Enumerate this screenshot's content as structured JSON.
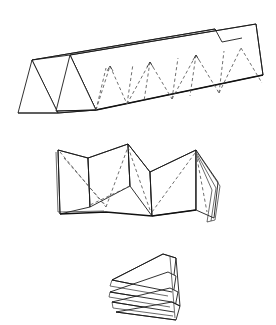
{
  "document": {
    "title": "Folded Paper Structures",
    "background_color": "#ffffff",
    "width": 276,
    "height": 325,
    "description": "Line drawing of three origami / pleated paper folding stages"
  },
  "style": {
    "solid_stroke_color": "#1a1a1a",
    "thick_stroke_color": "#111111",
    "dashed_stroke_color": "#555555",
    "face_fill_color": "#ffffff",
    "dash_pattern": "3.2 2.6"
  },
  "figures": [
    {
      "id": "accordion-prism",
      "label": "Extended accordion pleat strip",
      "position": "top",
      "bounds": {
        "x": 12,
        "y": 16,
        "width": 252,
        "height": 102
      },
      "description": "Long triangular-prism accordion of folded paper seen in perspective, receding to the upper right, with dashed zig-zag crease lines along the inner face and two open triangular end profiles at the left"
    },
    {
      "id": "zigzag-fold",
      "label": "Compressed zig-zag fold",
      "position": "middle",
      "bounds": {
        "x": 48,
        "y": 142,
        "width": 172,
        "height": 82
      },
      "description": "Partially collapsed W-shaped pleated sheet with dashed diagonal creases and stacked layer edges at the right"
    },
    {
      "id": "stacked-wedge",
      "label": "Fully collapsed wedge stack",
      "position": "bottom",
      "bounds": {
        "x": 108,
        "y": 252,
        "width": 72,
        "height": 68
      },
      "description": "Completely folded stack of triangular wedge layers, apex at the upper right"
    }
  ],
  "geometry": {
    "accordion": {
      "ridge_line": [
        [
          32,
          60
        ],
        [
          262,
          22
        ]
      ],
      "base_line": [
        [
          30,
          113
        ],
        [
          258,
          75
        ]
      ],
      "end_triangles": [
        [
          [
            32,
            60
          ],
          [
            18,
            113
          ],
          [
            58,
            113
          ]
        ],
        [
          [
            70,
            55
          ],
          [
            56,
            110
          ],
          [
            96,
            110
          ]
        ]
      ],
      "dashed_peaks": [
        [
          106,
          70
        ],
        [
          150,
          63
        ],
        [
          196,
          56
        ],
        [
          240,
          49
        ]
      ],
      "dashed_valleys": [
        [
          128,
          100
        ],
        [
          172,
          93
        ],
        [
          218,
          86
        ]
      ]
    },
    "zigzag": {
      "top_vertices": [
        [
          58,
          150
        ],
        [
          128,
          144
        ],
        [
          196,
          150
        ]
      ],
      "bottom_vertices": [
        [
          60,
          214
        ],
        [
          106,
          212
        ],
        [
          152,
          216
        ],
        [
          196,
          210
        ]
      ],
      "layer_edges_right": [
        [
          200,
          160
        ],
        [
          218,
          218
        ]
      ]
    },
    "wedge": {
      "apex": [
        [
          163,
          254
        ]
      ],
      "layers": 4,
      "tail": [
        [
          110,
          292
        ],
        [
          180,
          318
        ]
      ]
    }
  }
}
